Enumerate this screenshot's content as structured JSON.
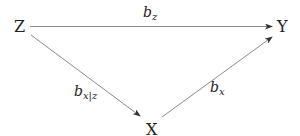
{
  "diagram": {
    "type": "causal-dag",
    "nodes": [
      {
        "id": "Z",
        "label": "Z"
      },
      {
        "id": "Y",
        "label": "Y"
      },
      {
        "id": "X",
        "label": "X"
      }
    ],
    "edges": [
      {
        "from": "Z",
        "to": "Y",
        "label_base": "b",
        "label_sub": "z"
      },
      {
        "from": "Z",
        "to": "X",
        "label_base": "b",
        "label_sub": "x|z"
      },
      {
        "from": "X",
        "to": "Y",
        "label_base": "b",
        "label_sub": "x"
      }
    ],
    "colors": {
      "edge": "#8a8a8a",
      "arrowhead": "#333333",
      "text": "#222222"
    }
  }
}
